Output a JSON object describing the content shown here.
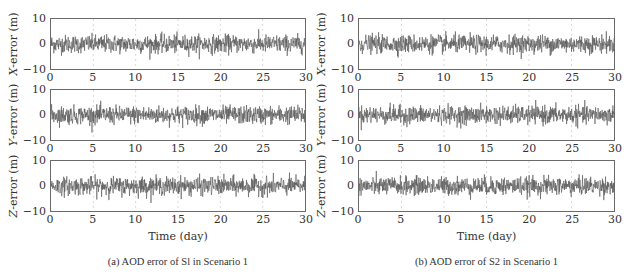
{
  "chart_data": [
    {
      "type": "line",
      "caption": "(a)  AOD error of Sl in Scenario 1",
      "subplots": [
        {
          "ylabel_var": "X",
          "ylabel_rest": "-error (m)",
          "ylim": [
            -10,
            10
          ],
          "yticks": [
            "10",
            "0",
            "−10"
          ],
          "xlim": [
            0,
            30
          ],
          "xticks": [
            "0",
            "5",
            "10",
            "15",
            "20",
            "25",
            "30"
          ],
          "noise_std": 1.8,
          "peak": 6,
          "grid": "dashed vertical at x ticks"
        },
        {
          "ylabel_var": "Y",
          "ylabel_rest": "-error (m)",
          "ylim": [
            -10,
            10
          ],
          "yticks": [
            "10",
            "0",
            "−10"
          ],
          "xlim": [
            0,
            30
          ],
          "xticks": [
            "0",
            "5",
            "10",
            "15",
            "20",
            "25",
            "30"
          ],
          "noise_std": 1.8,
          "peak": 6
        },
        {
          "ylabel_var": "Z",
          "ylabel_rest": "-error (m)",
          "ylim": [
            -10,
            10
          ],
          "yticks": [
            "10",
            "0",
            "−10"
          ],
          "xlim": [
            0,
            30
          ],
          "xticks": [
            "0",
            "5",
            "10",
            "15",
            "20",
            "25",
            "30"
          ],
          "noise_std": 1.8,
          "peak": 6
        }
      ],
      "xlabel": "Time (day)",
      "series_color": "#555555"
    },
    {
      "type": "line",
      "caption": "(b)  AOD error of S2 in Scenario 1",
      "subplots": [
        {
          "ylabel_var": "X",
          "ylabel_rest": "-error (m)",
          "ylim": [
            -10,
            10
          ],
          "yticks": [
            "10",
            "0",
            "−10"
          ],
          "xlim": [
            0,
            30
          ],
          "xticks": [
            "0",
            "5",
            "10",
            "15",
            "20",
            "25",
            "30"
          ],
          "noise_std": 1.8,
          "peak": 6
        },
        {
          "ylabel_var": "Y",
          "ylabel_rest": "-error (m)",
          "ylim": [
            -10,
            10
          ],
          "yticks": [
            "10",
            "0",
            "−10"
          ],
          "xlim": [
            0,
            30
          ],
          "xticks": [
            "0",
            "5",
            "10",
            "15",
            "20",
            "25",
            "30"
          ],
          "noise_std": 1.8,
          "peak": 6
        },
        {
          "ylabel_var": "Z",
          "ylabel_rest": "-error (m)",
          "ylim": [
            -10,
            10
          ],
          "yticks": [
            "10",
            "0",
            "−10"
          ],
          "xlim": [
            0,
            30
          ],
          "xticks": [
            "0",
            "5",
            "10",
            "15",
            "20",
            "25",
            "30"
          ],
          "noise_std": 1.8,
          "peak": 6
        }
      ],
      "xlabel": "Time (day)",
      "series_color": "#555555"
    }
  ]
}
